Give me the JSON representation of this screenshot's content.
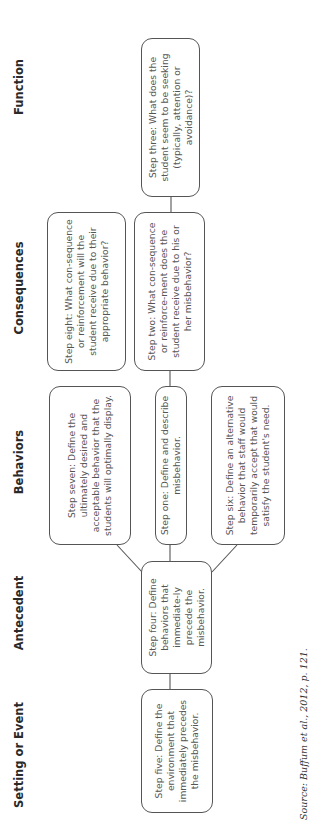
{
  "headers": {
    "setting": "Setting or Event",
    "antecedent": "Antecedent",
    "behaviors": "Behaviors",
    "consequences": "Consequences",
    "function": "Function"
  },
  "steps": {
    "one": "Step one: Define and describe misbehavior.",
    "two": "Step two: What con-sequence or reinforce-ment does the student receive due to his or her misbehavior?",
    "three": "Step three: What does the student seem to be seeking (typically, attention or avoidance)?",
    "four": "Step four: Define behaviors that immediate-ly precede the misbehavior.",
    "five": "Step five: Define the environment that immediately precedes the misbehavior.",
    "six": "Step six: Define an alternative behavior that staff would temporarily accept that would satisfy the student's need.",
    "seven": "Step seven: Define the ultimately desired and acceptable behavior that the students will optimally display.",
    "eight": "Step eight: What con-sequence or reinforcement will the student receive due to their appropriate behavior?"
  },
  "source": "Source: Buffum et al., 2012, p. 121.",
  "colors": {
    "border": "#555555",
    "header_text": "#2a2a2a",
    "body_text": "#555555",
    "background": "#ffffff"
  }
}
